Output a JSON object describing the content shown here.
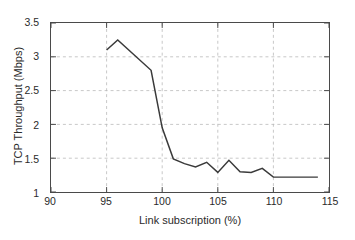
{
  "chart_data": {
    "type": "line",
    "title": "",
    "xlabel": "Link subscription (%)",
    "ylabel": "TCP Throughput (Mbps)",
    "xlim": [
      90,
      115
    ],
    "ylim": [
      1,
      3.5
    ],
    "xticks": [
      90,
      95,
      100,
      105,
      110,
      115
    ],
    "yticks": [
      1,
      1.5,
      2,
      2.5,
      3,
      3.5
    ],
    "xtick_labels": [
      "90",
      "95",
      "100",
      "105",
      "110",
      "115"
    ],
    "ytick_labels": [
      "1",
      "1.5",
      "2",
      "2.5",
      "3",
      "3.5"
    ],
    "grid": true,
    "grid_style": "dashed",
    "legend": null,
    "series": [
      {
        "name": "TCP Throughput",
        "color": "#3a3a3a",
        "x": [
          95,
          96,
          99,
          100,
          101,
          102,
          103,
          104,
          105,
          106,
          107,
          108,
          109,
          110,
          114
        ],
        "values": [
          3.1,
          3.25,
          2.8,
          1.95,
          1.49,
          1.42,
          1.37,
          1.44,
          1.29,
          1.47,
          1.3,
          1.29,
          1.35,
          1.22,
          1.22
        ]
      }
    ]
  },
  "axes": {
    "x_title": "Link subscription (%)",
    "y_title": "TCP Throughput (Mbps)"
  }
}
